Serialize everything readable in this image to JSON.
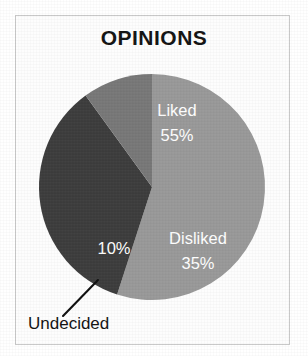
{
  "figure": {
    "width": 308,
    "height": 356,
    "background_color": "#ffffff",
    "frame_color": "#c9c9c9"
  },
  "chart_data": {
    "type": "pie",
    "title": "OPINIONS",
    "xlabel": "",
    "ylabel": "",
    "categories": [
      "Liked",
      "Disliked",
      "Undecided"
    ],
    "values": [
      55,
      35,
      10
    ],
    "value_labels": [
      "55%",
      "35%",
      "10%"
    ],
    "unit": "%",
    "total": 100,
    "legend": "none",
    "grid": false,
    "start_angle_deg": 0,
    "direction": "clockwise",
    "center": {
      "x": 152,
      "y": 187
    },
    "radius": 113,
    "slices": [
      {
        "name": "Liked",
        "label": "Liked",
        "value": 55,
        "value_label": "55%",
        "color": "#999999",
        "label_color": "#ffffff",
        "label_placement": "inside",
        "label_x": 177,
        "label_y": 112,
        "value_x": 177,
        "value_y": 137,
        "start_deg": 0,
        "end_deg": 198
      },
      {
        "name": "Disliked",
        "label": "Disliked",
        "value": 35,
        "value_label": "35%",
        "color": "#3d3d3d",
        "label_color": "#ffffff",
        "label_placement": "inside",
        "label_x": 198,
        "label_y": 240,
        "value_x": 198,
        "value_y": 265,
        "start_deg": 198,
        "end_deg": 324
      },
      {
        "name": "Undecided",
        "label": "Undecided",
        "value": 10,
        "value_label": "10%",
        "color": "#787878",
        "label_color": "#131313",
        "value_color": "#ffffff",
        "label_placement": "callout",
        "value_x": 114,
        "value_y": 250,
        "callout_label_x": 28,
        "callout_label_y": 325,
        "leader_from_x": 63,
        "leader_from_y": 316,
        "leader_to_x": 98,
        "leader_to_y": 280,
        "start_deg": 324,
        "end_deg": 360
      }
    ]
  }
}
